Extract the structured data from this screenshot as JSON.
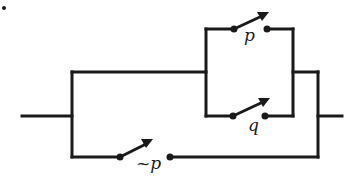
{
  "figure": {
    "marker": "."
  },
  "switches": [
    {
      "id": "p",
      "label": "p",
      "branch": "upper-parallel-top"
    },
    {
      "id": "q",
      "label": "q",
      "branch": "upper-parallel-bottom"
    },
    {
      "id": "not-p",
      "label": "~p",
      "branch": "lower"
    }
  ],
  "colors": {
    "wire": "#1a1a1a",
    "background": "#ffffff"
  }
}
